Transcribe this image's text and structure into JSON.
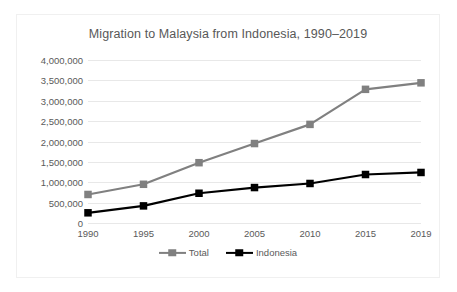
{
  "chart_data": {
    "type": "line",
    "title": "Migration to Malaysia from Indonesia, 1990–2019",
    "xlabel": "",
    "ylabel": "",
    "categories": [
      "1990",
      "1995",
      "2000",
      "2005",
      "2010",
      "2015",
      "2019"
    ],
    "x": [
      1990,
      1995,
      2000,
      2005,
      2010,
      2015,
      2019
    ],
    "series": [
      {
        "name": "Total",
        "color": "#808080",
        "marker": "square",
        "values": [
          700000,
          950000,
          1480000,
          1950000,
          2420000,
          3280000,
          3440000
        ]
      },
      {
        "name": "Indonesia",
        "color": "#000000",
        "marker": "square",
        "values": [
          250000,
          420000,
          730000,
          870000,
          970000,
          1190000,
          1240000
        ]
      }
    ],
    "ylim": [
      0,
      4000000
    ],
    "ytick_values": [
      0,
      500000,
      1000000,
      1500000,
      2000000,
      2500000,
      3000000,
      3500000,
      4000000
    ],
    "ytick_labels": [
      "0",
      "500,000",
      "1,000,000",
      "1,500,000",
      "2,000,000",
      "2,500,000",
      "3,000,000",
      "3,500,000",
      "4,000,000"
    ],
    "grid": true,
    "grid_color": "#e8e8e8",
    "legend_position": "bottom",
    "plot_background": "#ffffff",
    "text_color": "#5a5a5a",
    "border_color": "#f0f0f0"
  },
  "legend": {
    "entries": [
      {
        "label": "Total"
      },
      {
        "label": "Indonesia"
      }
    ]
  }
}
